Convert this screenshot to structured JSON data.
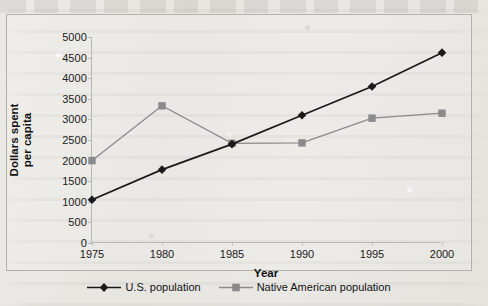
{
  "chart_data": {
    "type": "line",
    "title": "",
    "xlabel": "Year",
    "ylabel": "Dollars spent per capita",
    "categories": [
      "1975",
      "1980",
      "1985",
      "1990",
      "1995",
      "2000"
    ],
    "x": [
      1975,
      1980,
      1985,
      1990,
      1995,
      2000
    ],
    "xlim": [
      1975,
      2000
    ],
    "ylim": [
      0,
      5000
    ],
    "ytick_labels": [
      "0",
      "500",
      "1000",
      "1500",
      "2000",
      "2500",
      "3000",
      "3500",
      "4000",
      "4500",
      "5000"
    ],
    "ytick_values": [
      0,
      500,
      1000,
      1500,
      2000,
      2500,
      3000,
      3500,
      4000,
      4500,
      5000
    ],
    "grid": false,
    "legend_position": "bottom",
    "series": [
      {
        "name": "U.S. population",
        "marker": "diamond",
        "color": "#1a1a1a",
        "values": [
          1050,
          1780,
          2400,
          3100,
          3800,
          4620
        ]
      },
      {
        "name": "Native American population",
        "marker": "square",
        "color": "#8a8a8a",
        "values": [
          2000,
          3330,
          2420,
          2430,
          3030,
          3150
        ]
      }
    ]
  },
  "legend": {
    "items": [
      {
        "label": "U.S. population"
      },
      {
        "label": "Native American population"
      }
    ]
  },
  "axes": {
    "x_title": "Year",
    "y_title_line1": "Dollars spent",
    "y_title_line2": "per capita"
  }
}
